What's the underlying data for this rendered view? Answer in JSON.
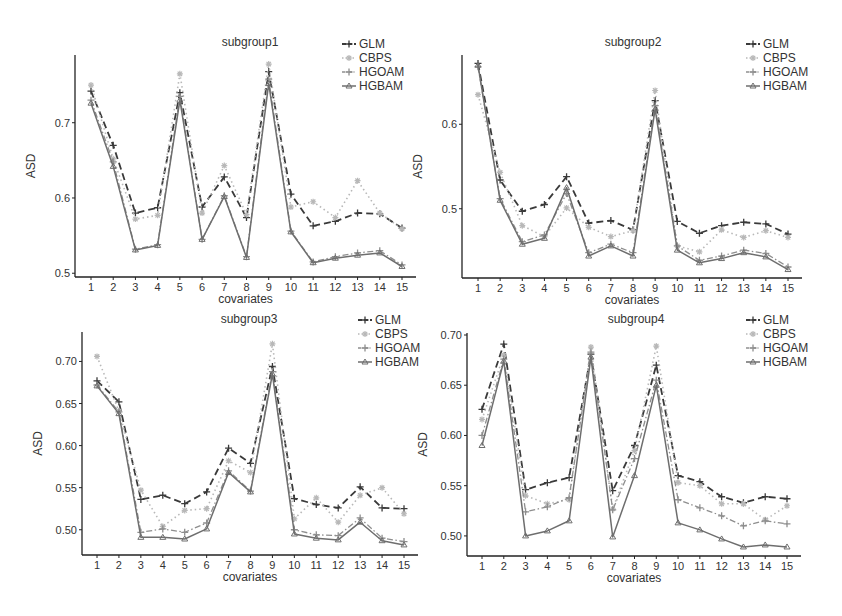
{
  "figure": {
    "legend": [
      "GLM",
      "CBPS",
      "HGOAM",
      "HGBAM"
    ]
  },
  "styles": {
    "GLM": {
      "color": "#3a3a3a",
      "dash": "7,4",
      "width": 1.8,
      "marker": "plus"
    },
    "CBPS": {
      "color": "#b8b8b8",
      "dash": "1.5,3",
      "width": 1.6,
      "marker": "star"
    },
    "HGOAM": {
      "color": "#8e8e8e",
      "dash": "6,2.5,1.5,2.5",
      "width": 1.3,
      "marker": "plus"
    },
    "HGBAM": {
      "color": "#6e6e6e",
      "dash": "",
      "width": 1.5,
      "marker": "tri"
    }
  },
  "chart_data": [
    {
      "type": "line",
      "title": "subgroup1",
      "xlabel": "covariates",
      "ylabel": "ASD",
      "categories": [
        1,
        2,
        3,
        4,
        5,
        6,
        7,
        8,
        9,
        10,
        11,
        12,
        13,
        14,
        15
      ],
      "yticks": [
        "0.5",
        "0.6",
        "0.7"
      ],
      "ytick_values": [
        0.5,
        0.6,
        0.7
      ],
      "ylim": [
        0.495,
        0.79
      ],
      "layout": {
        "left": 75,
        "top": 55,
        "bottom": 277,
        "x1": 91,
        "x15": 402
      },
      "legend_pos": {
        "x": 342,
        "y": 44
      },
      "title_pos": {
        "x": 250,
        "y": 46
      },
      "series": [
        {
          "name": "GLM",
          "values": [
            0.742,
            0.67,
            0.58,
            0.587,
            0.74,
            0.588,
            0.628,
            0.574,
            0.768,
            0.605,
            0.563,
            0.569,
            0.58,
            0.579,
            0.56
          ]
        },
        {
          "name": "CBPS",
          "values": [
            0.75,
            0.652,
            0.572,
            0.577,
            0.765,
            0.58,
            0.643,
            0.578,
            0.778,
            0.588,
            0.595,
            0.574,
            0.623,
            0.58,
            0.559
          ]
        },
        {
          "name": "HGOAM",
          "values": [
            0.73,
            0.648,
            0.532,
            0.538,
            0.735,
            0.545,
            0.603,
            0.522,
            0.758,
            0.556,
            0.515,
            0.522,
            0.527,
            0.53,
            0.511
          ]
        },
        {
          "name": "HGBAM",
          "values": [
            0.726,
            0.642,
            0.531,
            0.537,
            0.73,
            0.545,
            0.602,
            0.521,
            0.752,
            0.555,
            0.514,
            0.52,
            0.524,
            0.527,
            0.509
          ]
        }
      ]
    },
    {
      "type": "line",
      "title": "subgroup2",
      "xlabel": "covariates",
      "ylabel": "ASD",
      "categories": [
        1,
        2,
        3,
        4,
        5,
        6,
        7,
        8,
        9,
        10,
        11,
        12,
        13,
        14,
        15
      ],
      "yticks": [
        "0.5",
        "0.6"
      ],
      "ytick_values": [
        0.5,
        0.6
      ],
      "ylim": [
        0.418,
        0.682
      ],
      "layout": {
        "left": 462,
        "top": 55,
        "bottom": 278,
        "x1": 478,
        "x15": 788
      },
      "legend_pos": {
        "x": 746,
        "y": 44
      },
      "title_pos": {
        "x": 633,
        "y": 46
      },
      "series": [
        {
          "name": "GLM",
          "values": [
            0.672,
            0.534,
            0.497,
            0.505,
            0.538,
            0.483,
            0.486,
            0.475,
            0.628,
            0.485,
            0.471,
            0.48,
            0.484,
            0.482,
            0.47
          ]
        },
        {
          "name": "CBPS",
          "values": [
            0.635,
            0.543,
            0.48,
            0.467,
            0.501,
            0.478,
            0.467,
            0.474,
            0.64,
            0.456,
            0.449,
            0.475,
            0.466,
            0.474,
            0.466
          ]
        },
        {
          "name": "HGOAM",
          "values": [
            0.668,
            0.512,
            0.461,
            0.469,
            0.518,
            0.448,
            0.458,
            0.448,
            0.622,
            0.456,
            0.439,
            0.444,
            0.451,
            0.447,
            0.431
          ]
        },
        {
          "name": "HGBAM",
          "values": [
            0.67,
            0.51,
            0.458,
            0.465,
            0.525,
            0.444,
            0.456,
            0.444,
            0.618,
            0.451,
            0.436,
            0.441,
            0.448,
            0.443,
            0.428
          ]
        }
      ]
    },
    {
      "type": "line",
      "title": "subgroup3",
      "xlabel": "covariates",
      "ylabel": "ASD",
      "categories": [
        1,
        2,
        3,
        4,
        5,
        6,
        7,
        8,
        9,
        10,
        11,
        12,
        13,
        14,
        15
      ],
      "yticks": [
        "0.50",
        "0.55",
        "0.60",
        "0.65",
        "0.70"
      ],
      "ytick_values": [
        0.5,
        0.55,
        0.6,
        0.65,
        0.7
      ],
      "ylim": [
        0.47,
        0.735
      ],
      "layout": {
        "left": 82,
        "top": 332,
        "bottom": 555,
        "x1": 97,
        "x15": 404
      },
      "legend_pos": {
        "x": 358,
        "y": 320
      },
      "title_pos": {
        "x": 249,
        "y": 323
      },
      "series": [
        {
          "name": "GLM",
          "values": [
            0.677,
            0.652,
            0.536,
            0.541,
            0.531,
            0.545,
            0.597,
            0.579,
            0.694,
            0.537,
            0.53,
            0.526,
            0.551,
            0.526,
            0.525
          ]
        },
        {
          "name": "CBPS",
          "values": [
            0.706,
            0.641,
            0.547,
            0.504,
            0.523,
            0.525,
            0.582,
            0.568,
            0.721,
            0.513,
            0.538,
            0.509,
            0.541,
            0.55,
            0.519
          ]
        },
        {
          "name": "HGOAM",
          "values": [
            0.672,
            0.64,
            0.497,
            0.501,
            0.497,
            0.508,
            0.57,
            0.546,
            0.688,
            0.5,
            0.494,
            0.493,
            0.514,
            0.49,
            0.486
          ]
        },
        {
          "name": "HGBAM",
          "values": [
            0.671,
            0.638,
            0.491,
            0.491,
            0.489,
            0.501,
            0.568,
            0.545,
            0.685,
            0.495,
            0.49,
            0.488,
            0.509,
            0.487,
            0.482
          ]
        }
      ]
    },
    {
      "type": "line",
      "title": "subgroup4",
      "xlabel": "covariates",
      "ylabel": "ASD",
      "categories": [
        1,
        2,
        3,
        4,
        5,
        6,
        7,
        8,
        9,
        10,
        11,
        12,
        13,
        14,
        15
      ],
      "yticks": [
        "0.50",
        "0.55",
        "0.60",
        "0.65",
        "0.70"
      ],
      "ytick_values": [
        0.5,
        0.55,
        0.6,
        0.65,
        0.7
      ],
      "ylim": [
        0.48,
        0.702
      ],
      "layout": {
        "left": 467,
        "top": 333,
        "bottom": 556,
        "x1": 482,
        "x15": 787
      },
      "legend_pos": {
        "x": 746,
        "y": 320
      },
      "title_pos": {
        "x": 636,
        "y": 323
      },
      "series": [
        {
          "name": "GLM",
          "values": [
            0.626,
            0.691,
            0.546,
            0.553,
            0.558,
            0.681,
            0.545,
            0.59,
            0.67,
            0.56,
            0.554,
            0.539,
            0.533,
            0.539,
            0.537
          ]
        },
        {
          "name": "CBPS",
          "values": [
            0.616,
            0.68,
            0.54,
            0.532,
            0.536,
            0.688,
            0.527,
            0.585,
            0.689,
            0.553,
            0.55,
            0.532,
            0.532,
            0.516,
            0.53
          ]
        },
        {
          "name": "HGOAM",
          "values": [
            0.6,
            0.676,
            0.524,
            0.529,
            0.538,
            0.683,
            0.526,
            0.577,
            0.655,
            0.536,
            0.528,
            0.52,
            0.51,
            0.515,
            0.512
          ]
        },
        {
          "name": "HGBAM",
          "values": [
            0.59,
            0.674,
            0.5,
            0.505,
            0.515,
            0.678,
            0.499,
            0.56,
            0.65,
            0.513,
            0.506,
            0.497,
            0.489,
            0.491,
            0.489
          ]
        }
      ]
    }
  ]
}
